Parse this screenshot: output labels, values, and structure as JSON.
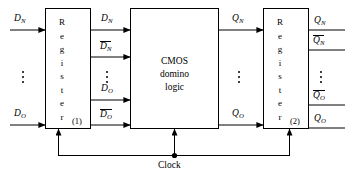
{
  "diagram": {
    "line_color": "#000000",
    "background": "#ffffff"
  },
  "blocks": [
    {
      "id": "register1",
      "label": "Register",
      "letters": [
        "R",
        "e",
        "g",
        "i",
        "s",
        "t",
        "e",
        "r"
      ],
      "index_label": "(1)"
    },
    {
      "id": "cmos",
      "line1": "CMOS",
      "line2": "domino",
      "line3": "logic"
    },
    {
      "id": "register2",
      "label": "Register",
      "letters": [
        "R",
        "e",
        "g",
        "i",
        "s",
        "t",
        "e",
        "r"
      ],
      "index_label": "(2)"
    }
  ],
  "inputs": [
    {
      "base": "D",
      "sub": "N",
      "overline": false
    },
    {
      "base": "D",
      "sub": "O",
      "overline": false
    }
  ],
  "mid_signals": [
    {
      "base": "D",
      "sub": "N",
      "overline": false
    },
    {
      "base": "D",
      "sub": "N",
      "overline": true
    },
    {
      "base": "D",
      "sub": "O",
      "overline": false
    },
    {
      "base": "D",
      "sub": "O",
      "overline": true
    }
  ],
  "logic_outputs": [
    {
      "base": "Q",
      "sub": "N",
      "overline": false
    },
    {
      "base": "Q",
      "sub": "O",
      "overline": false
    }
  ],
  "outputs": [
    {
      "base": "Q",
      "sub": "N",
      "overline": false
    },
    {
      "base": "Q",
      "sub": "N",
      "overline": true
    },
    {
      "base": "Q",
      "sub": "O",
      "overline": true
    },
    {
      "base": "Q",
      "sub": "O",
      "overline": false
    }
  ],
  "clock": {
    "label": "Clock"
  },
  "ellipsis": {
    "glyph": "vertical-dots"
  }
}
